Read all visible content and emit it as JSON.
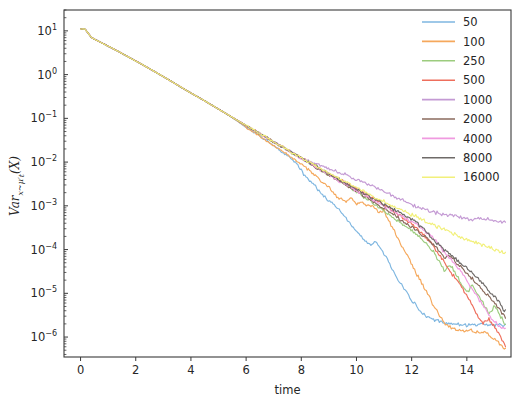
{
  "chart_data": {
    "type": "line",
    "title": "",
    "xlabel": "time",
    "ylabel": "Var_{x~μ'_t}(X)",
    "ylabel_parts": {
      "main": "Var",
      "sub": "x~μ′",
      "sub2": "t",
      "tail": "(X)"
    },
    "yscale": "log",
    "xscale": "linear",
    "xlim": [
      -0.6,
      15.6
    ],
    "ylim": [
      3.5e-07,
      30
    ],
    "grid": false,
    "legend_position": "upper right",
    "legend_title": "",
    "xticks": [
      0,
      2,
      4,
      6,
      8,
      10,
      12,
      14
    ],
    "xtick_labels": [
      "0",
      "2",
      "4",
      "6",
      "8",
      "10",
      "12",
      "14"
    ],
    "yticks": [
      10,
      1,
      0.1,
      0.01,
      0.001,
      0.0001,
      1e-05,
      1e-06
    ],
    "ytick_labels": [
      "10¹",
      "10⁰",
      "10⁻¹",
      "10⁻²",
      "10⁻³",
      "10⁻⁴",
      "10⁻⁵",
      "10⁻⁶"
    ],
    "ytick_mantissas": [
      "10",
      "10",
      "10",
      "10",
      "10",
      "10",
      "10",
      "10"
    ],
    "ytick_exponents": [
      "1",
      "0",
      "-1",
      "-2",
      "-3",
      "-4",
      "-5",
      "-6"
    ],
    "series": [
      {
        "name": "50",
        "color": "#7eb6e0",
        "x": [
          0,
          0.15,
          0.4,
          0.8,
          1.4,
          2.2,
          3.0,
          3.8,
          4.6,
          5.4,
          6.0,
          6.5,
          7.0,
          7.3,
          7.6,
          7.9,
          8.1,
          8.3,
          8.5,
          8.7,
          8.9,
          9.1,
          9.3,
          9.5,
          9.7,
          9.9,
          10.1,
          10.3,
          10.5,
          10.7,
          10.9,
          11.1,
          11.3,
          11.5,
          11.7,
          11.9,
          12.1,
          12.3,
          12.5,
          12.8,
          13.2,
          13.8,
          14.5,
          15.4
        ],
        "y": [
          11.0,
          11.2,
          7.0,
          5.2,
          3.3,
          1.75,
          0.9,
          0.45,
          0.23,
          0.115,
          0.062,
          0.04,
          0.0235,
          0.017,
          0.0125,
          0.0082,
          0.0051,
          0.0037,
          0.0029,
          0.00195,
          0.00148,
          0.00118,
          0.00092,
          0.00064,
          0.00045,
          0.00031,
          0.00022,
          0.00016,
          0.000125,
          0.000148,
          0.000105,
          6.2e-05,
          3.6e-05,
          2.15e-05,
          1.35e-05,
          8.8e-06,
          5.8e-06,
          4.1e-06,
          3.1e-06,
          2.5e-06,
          2.1e-06,
          1.9e-06,
          1.9e-06,
          1.9e-06
        ]
      },
      {
        "name": "100",
        "color": "#f5a85c",
        "x": [
          0,
          0.15,
          0.4,
          0.8,
          1.4,
          2.2,
          3.0,
          3.8,
          4.6,
          5.4,
          6.2,
          7.0,
          7.6,
          8.2,
          8.6,
          9.0,
          9.3,
          9.6,
          9.8,
          10.0,
          10.2,
          10.4,
          10.6,
          10.8,
          11.0,
          11.2,
          11.4,
          11.6,
          11.8,
          12.0,
          12.2,
          12.4,
          12.6,
          12.8,
          13.0,
          13.2,
          13.5,
          14.0,
          14.6,
          15.0,
          15.4
        ],
        "y": [
          11.0,
          11.2,
          7.0,
          5.2,
          3.3,
          1.75,
          0.9,
          0.45,
          0.23,
          0.115,
          0.052,
          0.0235,
          0.0135,
          0.0072,
          0.0044,
          0.0026,
          0.0016,
          0.00125,
          0.00155,
          0.0011,
          0.00122,
          0.00098,
          0.00105,
          0.00072,
          0.00078,
          0.00042,
          0.00024,
          0.000135,
          8e-05,
          4.6e-05,
          2.6e-05,
          1.55e-05,
          9.2e-06,
          5.2e-06,
          3.2e-06,
          2.1e-06,
          1.5e-06,
          1.4e-06,
          1.3e-06,
          9e-07,
          5.5e-07
        ]
      },
      {
        "name": "250",
        "color": "#9ccc7e",
        "x": [
          0,
          0.15,
          0.4,
          0.8,
          1.4,
          2.2,
          3.0,
          3.8,
          4.6,
          5.4,
          6.2,
          7.0,
          7.8,
          8.6,
          9.4,
          10.0,
          10.6,
          11.2,
          11.8,
          12.2,
          12.5,
          12.8,
          13.0,
          13.2,
          13.4,
          13.6,
          13.8,
          14.0,
          14.2,
          14.4,
          14.6,
          14.8,
          15.0,
          15.2,
          15.4
        ],
        "y": [
          11.0,
          11.2,
          7.0,
          5.2,
          3.3,
          1.75,
          0.9,
          0.45,
          0.23,
          0.115,
          0.058,
          0.029,
          0.0145,
          0.0072,
          0.0036,
          0.0021,
          0.00115,
          0.00062,
          0.00033,
          0.00021,
          0.000145,
          8.75e-05,
          5.25e-05,
          3.15e-05,
          4.68e-05,
          2.82e-05,
          1.69e-05,
          1.02e-05,
          1.58e-05,
          9.5e-06,
          5.7e-06,
          3.4e-06,
          5.2e-06,
          3.1e-06,
          1.9e-06
        ]
      },
      {
        "name": "500",
        "color": "#ee6e5c",
        "x": [
          0,
          0.15,
          0.4,
          0.8,
          1.4,
          2.2,
          3.0,
          3.8,
          4.6,
          5.4,
          6.2,
          7.0,
          7.8,
          8.6,
          9.4,
          10.2,
          10.8,
          11.4,
          12.0,
          12.4,
          12.8,
          13.1,
          13.4,
          13.7,
          14.0,
          14.2,
          14.4,
          14.6,
          14.8,
          15.0,
          15.2,
          15.4
        ],
        "y": [
          11.0,
          11.2,
          7.0,
          5.2,
          3.3,
          1.75,
          0.9,
          0.45,
          0.23,
          0.115,
          0.058,
          0.029,
          0.0148,
          0.0078,
          0.004,
          0.0021,
          0.00125,
          0.00072,
          0.00038,
          0.00022,
          0.000118,
          6.2e-05,
          3.25e-05,
          1.72e-05,
          9.2e-06,
          5.2e-06,
          2.9e-06,
          2.1e-06,
          2.5e-06,
          1.7e-06,
          1.1e-06,
          6e-07
        ]
      },
      {
        "name": "1000",
        "color": "#c49ad4",
        "x": [
          0,
          0.15,
          0.4,
          0.8,
          1.4,
          2.2,
          3.0,
          3.8,
          4.6,
          5.4,
          6.2,
          7.0,
          7.8,
          8.4,
          9.0,
          9.6,
          10.2,
          10.8,
          11.4,
          12.0,
          12.6,
          13.2,
          13.8,
          14.2,
          14.6,
          15.0,
          15.4
        ],
        "y": [
          11.0,
          11.2,
          7.0,
          5.2,
          3.3,
          1.75,
          0.9,
          0.45,
          0.23,
          0.115,
          0.058,
          0.029,
          0.0148,
          0.0098,
          0.0072,
          0.0052,
          0.0035,
          0.0024,
          0.0016,
          0.00105,
          0.00078,
          0.00062,
          0.00055,
          0.00048,
          0.00052,
          0.00045,
          0.00042
        ]
      },
      {
        "name": "2000",
        "color": "#8a6a5c",
        "x": [
          0,
          0.15,
          0.4,
          0.8,
          1.4,
          2.2,
          3.0,
          3.8,
          4.6,
          5.4,
          6.2,
          7.0,
          7.8,
          8.6,
          9.4,
          10.2,
          11.0,
          11.6,
          12.0,
          12.4,
          12.8,
          13.0,
          13.2,
          13.4,
          13.6,
          13.8,
          14.0,
          14.2,
          14.4,
          14.6,
          14.8,
          15.0,
          15.2,
          15.4
        ],
        "y": [
          11.0,
          11.2,
          7.0,
          5.2,
          3.3,
          1.75,
          0.9,
          0.45,
          0.23,
          0.115,
          0.058,
          0.029,
          0.0145,
          0.0072,
          0.0036,
          0.0018,
          0.00088,
          0.00048,
          0.000325,
          0.000215,
          0.000135,
          9.25e-05,
          6.2e-05,
          7.25e-05,
          5.25e-05,
          3.82e-05,
          2.85e-05,
          2.12e-05,
          1.58e-05,
          1.18e-05,
          8.8e-06,
          6.2e-06,
          4.2e-06,
          2.9e-06
        ]
      },
      {
        "name": "4000",
        "color": "#f09ae0",
        "x": [
          0,
          0.15,
          0.4,
          0.8,
          1.4,
          2.2,
          3.0,
          3.8,
          4.6,
          5.4,
          6.2,
          7.0,
          7.8,
          8.6,
          9.4,
          10.2,
          11.0,
          11.8,
          12.4,
          12.9,
          13.2,
          13.5,
          13.8,
          14.0,
          14.2,
          14.4,
          14.6,
          14.8,
          15.0,
          15.2,
          15.4
        ],
        "y": [
          11.0,
          11.2,
          7.0,
          5.2,
          3.3,
          1.75,
          0.9,
          0.45,
          0.23,
          0.115,
          0.058,
          0.029,
          0.0145,
          0.0072,
          0.0036,
          0.0019,
          0.00098,
          0.00052,
          0.000295,
          0.000158,
          8.25e-05,
          5.25e-05,
          3.22e-05,
          1.95e-05,
          1.22e-05,
          7.8e-06,
          4.8e-06,
          3.2e-06,
          2.2e-06,
          1.8e-06,
          1.6e-06
        ]
      },
      {
        "name": "8000",
        "color": "#6e6a68",
        "x": [
          0,
          0.15,
          0.4,
          0.8,
          1.4,
          2.2,
          3.0,
          3.8,
          4.6,
          5.4,
          6.2,
          7.0,
          7.8,
          8.6,
          9.4,
          10.2,
          11.0,
          11.6,
          12.0,
          12.4,
          12.8,
          13.2,
          13.5,
          13.8,
          14.0,
          14.2,
          14.4,
          14.6,
          14.8,
          15.0,
          15.2,
          15.4
        ],
        "y": [
          11.0,
          11.2,
          7.0,
          5.2,
          3.3,
          1.75,
          0.9,
          0.45,
          0.23,
          0.115,
          0.058,
          0.029,
          0.0148,
          0.0076,
          0.0039,
          0.00205,
          0.00108,
          0.00068,
          0.00048,
          0.000315,
          0.000168,
          9.35e-05,
          6.85e-05,
          4.85e-05,
          3.82e-05,
          2.95e-05,
          2.22e-05,
          1.62e-05,
          1.18e-05,
          8.5e-06,
          5.8e-06,
          3.9e-06
        ]
      },
      {
        "name": "16000",
        "color": "#f2f07a",
        "x": [
          0,
          0.15,
          0.4,
          0.8,
          1.4,
          2.2,
          3.0,
          3.8,
          4.6,
          5.4,
          6.2,
          7.0,
          7.8,
          8.6,
          9.4,
          10.2,
          11.0,
          11.8,
          12.4,
          13.0,
          13.6,
          14.2,
          14.8,
          15.4
        ],
        "y": [
          11.0,
          11.2,
          7.0,
          5.2,
          3.3,
          1.75,
          0.9,
          0.45,
          0.23,
          0.115,
          0.058,
          0.029,
          0.0148,
          0.0078,
          0.0041,
          0.00225,
          0.00125,
          0.00072,
          0.00048,
          0.00032,
          0.00022,
          0.000155,
          0.000112,
          8.2e-05
        ]
      }
    ]
  },
  "axes": {
    "x_axis_label": "time",
    "y_axis_label": "Var"
  },
  "legend": {
    "entries": [
      {
        "label": "50",
        "color": "#7eb6e0"
      },
      {
        "label": "100",
        "color": "#f5a85c"
      },
      {
        "label": "250",
        "color": "#9ccc7e"
      },
      {
        "label": "500",
        "color": "#ee6e5c"
      },
      {
        "label": "1000",
        "color": "#c49ad4"
      },
      {
        "label": "2000",
        "color": "#8a6a5c"
      },
      {
        "label": "4000",
        "color": "#f09ae0"
      },
      {
        "label": "8000",
        "color": "#6e6a68"
      },
      {
        "label": "16000",
        "color": "#f2f07a"
      }
    ]
  }
}
